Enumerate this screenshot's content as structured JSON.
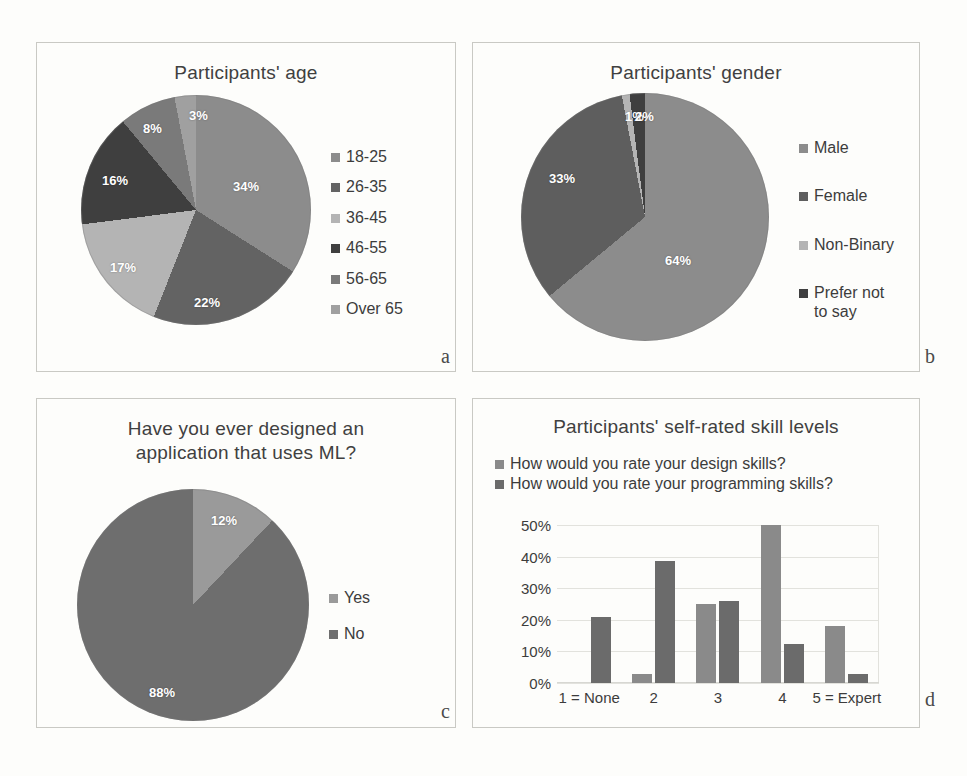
{
  "figure": {
    "panel_letters": {
      "a": "a",
      "b": "b",
      "c": "c",
      "d": "d"
    }
  },
  "palette": {
    "gray1": "#8c8c8c",
    "gray2": "#636363",
    "gray3": "#b4b4b4",
    "gray4": "#3f3f3f",
    "gray5": "#7a7a7a",
    "gray6": "#a0a0a0",
    "bar_series1": "#8a8a8a",
    "bar_series2": "#6b6b6b",
    "grid": "#e2e2dd",
    "panel_border": "#c9c9c4",
    "background": "#fdfdfb"
  },
  "chart_data": [
    {
      "type": "pie",
      "panel": "a",
      "title": "Participants' age",
      "categories": [
        "18-25",
        "26-35",
        "36-45",
        "46-55",
        "56-65",
        "Over 65"
      ],
      "values": [
        34,
        22,
        17,
        16,
        8,
        3
      ],
      "labels": [
        "34%",
        "22%",
        "17%",
        "16%",
        "8%",
        "3%"
      ],
      "colors": [
        "#8c8c8c",
        "#636363",
        "#b4b4b4",
        "#3f3f3f",
        "#7a7a7a",
        "#a0a0a0"
      ],
      "legend_position": "right",
      "legend": [
        "18-25",
        "26-35",
        "36-45",
        "46-55",
        "56-65",
        "Over 65"
      ]
    },
    {
      "type": "pie",
      "panel": "b",
      "title": "Participants' gender",
      "categories": [
        "Male",
        "Female",
        "Non-Binary",
        "Prefer not to say"
      ],
      "values": [
        64,
        33,
        1,
        2
      ],
      "labels": [
        "64%",
        "33%",
        "1%",
        "2%"
      ],
      "colors": [
        "#8c8c8c",
        "#5e5e5e",
        "#b4b4b4",
        "#3f3f3f"
      ],
      "legend_position": "right",
      "legend": [
        "Male",
        "Female",
        "Non-Binary",
        "Prefer not\nto say"
      ]
    },
    {
      "type": "pie",
      "panel": "c",
      "title": "Have you ever designed an application that uses ML?",
      "title_lines": [
        "Have you ever designed an",
        "application that uses ML?"
      ],
      "categories": [
        "Yes",
        "No"
      ],
      "values": [
        12,
        88
      ],
      "labels": [
        "12%",
        "88%"
      ],
      "colors": [
        "#9a9a9a",
        "#6e6e6e"
      ],
      "legend_position": "right",
      "legend": [
        "Yes",
        "No"
      ]
    },
    {
      "type": "bar",
      "panel": "d",
      "title": "Participants' self-rated skill levels",
      "categories": [
        "1 = None",
        "2",
        "3",
        "4",
        "5 = Expert"
      ],
      "series": [
        {
          "name": "How would you rate your design skills?",
          "values": [
            0,
            3,
            25,
            50,
            18
          ],
          "color": "#8a8a8a"
        },
        {
          "name": "How would you rate your programming skills?",
          "values": [
            21,
            38.5,
            26,
            12.5,
            3
          ],
          "color": "#6b6b6b"
        }
      ],
      "yticks": [
        "0%",
        "10%",
        "20%",
        "30%",
        "40%",
        "50%"
      ],
      "ytick_values": [
        0,
        10,
        20,
        30,
        40,
        50
      ],
      "ylim": [
        0,
        50
      ],
      "xlabel": "",
      "ylabel": "",
      "grid": true,
      "legend_position": "top"
    }
  ]
}
